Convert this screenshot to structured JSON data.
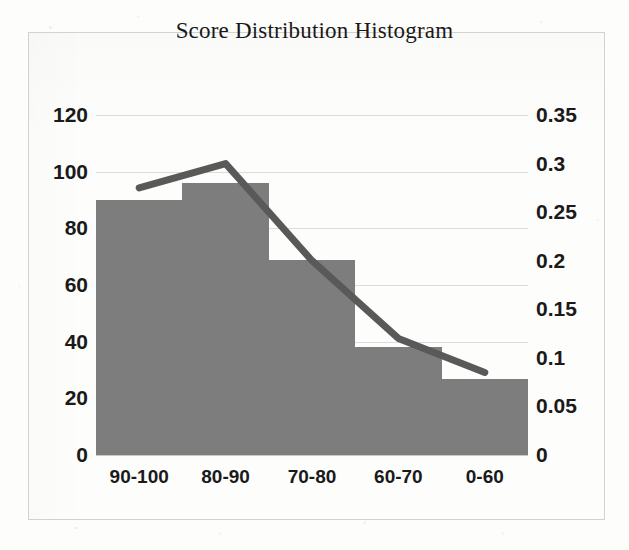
{
  "chart_data": {
    "type": "bar",
    "title": "Score Distribution Histogram",
    "xlabel": "",
    "ylabel": "",
    "categories": [
      "90-100",
      "80-90",
      "70-80",
      "60-70",
      "0-60"
    ],
    "series": [
      {
        "name": "Frequency",
        "type": "bar",
        "axis": "left",
        "color": "#7d7d7d",
        "values": [
          90,
          96,
          69,
          38,
          27
        ]
      },
      {
        "name": "Cumulative / Proportion",
        "type": "line",
        "axis": "right",
        "color": "#595959",
        "values": [
          0.275,
          0.3,
          0.2,
          0.12,
          0.085
        ]
      }
    ],
    "left_axis": {
      "ticks": [
        "0",
        "20",
        "40",
        "60",
        "80",
        "100",
        "120"
      ],
      "values": [
        0,
        20,
        40,
        60,
        80,
        100,
        120
      ],
      "ylim": [
        0,
        120
      ]
    },
    "right_axis": {
      "ticks": [
        "0",
        "0.05",
        "0.1",
        "0.15",
        "0.2",
        "0.25",
        "0.3",
        "0.35"
      ],
      "values": [
        0,
        0.05,
        0.1,
        0.15,
        0.2,
        0.25,
        0.3,
        0.35
      ],
      "ylim": [
        0,
        0.35
      ]
    },
    "grid": true,
    "legend": "none",
    "gridline_color": "#dcdcdc",
    "frame_color": "#d2d2d2",
    "background": "#fdfdfc"
  }
}
